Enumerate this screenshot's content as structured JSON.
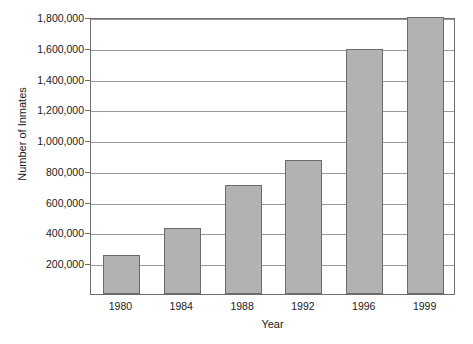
{
  "chart_data": {
    "type": "bar",
    "title": "",
    "xlabel": "Year",
    "ylabel": "Number of Inmates",
    "categories": [
      "1980",
      "1984",
      "1988",
      "1992",
      "1996",
      "1999"
    ],
    "values": [
      255000,
      430000,
      710000,
      870000,
      1595000,
      1800000
    ],
    "ylim": [
      0,
      1800000
    ],
    "xlim_categories": 6,
    "y_ticks": [
      200000,
      400000,
      600000,
      800000,
      1000000,
      1200000,
      1400000,
      1600000,
      1800000
    ],
    "y_tick_labels": [
      "200,000",
      "400,000",
      "600,000",
      "800,000",
      "1,000,000",
      "1,200,000",
      "1,400,000",
      "1,600,000",
      "1,800,000"
    ],
    "grid": true,
    "grid_axis": "y",
    "legend": false,
    "legend_position": "none",
    "bar_fill_color": "#b2b2b2",
    "bar_edge_color": "#6b6b6b",
    "gridline_color": "#9a9a9a",
    "frame_color": "#6e6e6e",
    "background_color": "#ffffff",
    "text_color": "#1a1a1a"
  }
}
